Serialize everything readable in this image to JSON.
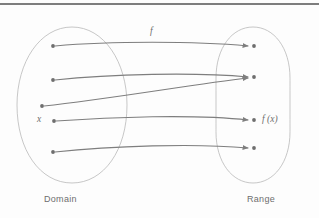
{
  "figure": {
    "type": "function-mapping-diagram",
    "title": "",
    "top_rule": true,
    "captions": {
      "domain": "Domain",
      "range": "Range"
    },
    "labels": {
      "function": "f",
      "element": "x",
      "image": "f (x)"
    },
    "colors": {
      "background": "#fdfdfd",
      "rule": "#7d7d7d",
      "oval_stroke": "#b9b9b9",
      "arrow_stroke": "#7e7e7e",
      "dot_fill": "#6e6e6e",
      "text": "#6e6e6e"
    },
    "sets": [
      {
        "name": "Domain",
        "shape": "oval",
        "cx": 72,
        "cy": 105,
        "rx": 55,
        "ry": 78,
        "points": [
          {
            "id": "d1",
            "x": 53,
            "y": 46,
            "label": ""
          },
          {
            "id": "d2",
            "x": 53,
            "y": 80,
            "label": ""
          },
          {
            "id": "d3",
            "x": 42,
            "y": 106,
            "label": ""
          },
          {
            "id": "d4",
            "x": 54,
            "y": 121,
            "label": "x"
          },
          {
            "id": "d5",
            "x": 53,
            "y": 152,
            "label": ""
          }
        ]
      },
      {
        "name": "Range",
        "shape": "oval",
        "cx": 253,
        "cy": 105,
        "rx": 37,
        "ry": 78,
        "points": [
          {
            "id": "r1",
            "x": 254,
            "y": 46,
            "label": ""
          },
          {
            "id": "r2",
            "x": 254,
            "y": 77,
            "label": ""
          },
          {
            "id": "r3",
            "x": 254,
            "y": 120,
            "label": "f (x)"
          },
          {
            "id": "r4",
            "x": 254,
            "y": 148,
            "label": ""
          }
        ]
      }
    ],
    "mappings": [
      {
        "from": "d1",
        "to": "r1",
        "note": "top arrow, labeled f"
      },
      {
        "from": "d2",
        "to": "r2",
        "note": "second arrow"
      },
      {
        "from": "d3",
        "to": "r2",
        "note": "third arrow, rises to same target as second"
      },
      {
        "from": "d4",
        "to": "r3",
        "note": "x maps to f (x)"
      },
      {
        "from": "d5",
        "to": "r4",
        "note": "bottom arrow"
      }
    ]
  }
}
